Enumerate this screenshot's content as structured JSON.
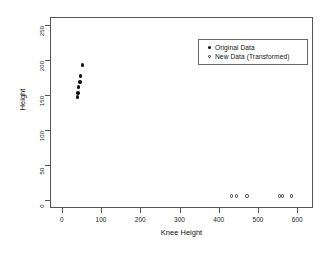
{
  "chart_data": {
    "type": "scatter",
    "title": "",
    "xlabel": "Knee Height",
    "ylabel": "Height",
    "xlim": [
      -30,
      640
    ],
    "ylim": [
      -12,
      262
    ],
    "xticks": [
      0,
      100,
      200,
      300,
      400,
      500,
      600
    ],
    "yticks": [
      0,
      50,
      100,
      150,
      200,
      250
    ],
    "xtick_labels": [
      "0",
      "100",
      "200",
      "300",
      "400",
      "500",
      "600"
    ],
    "ytick_labels": [
      "0",
      "50",
      "100",
      "150",
      "200",
      "250"
    ],
    "grid": false,
    "legend_position": "top-right",
    "series": [
      {
        "name": "Original Data",
        "marker": "filled-circle",
        "color": "#111111",
        "points": [
          {
            "x": 53,
            "y": 193
          },
          {
            "x": 48,
            "y": 177
          },
          {
            "x": 46,
            "y": 169
          },
          {
            "x": 43,
            "y": 162
          },
          {
            "x": 41,
            "y": 153
          },
          {
            "x": 40,
            "y": 147
          }
        ]
      },
      {
        "name": "New Data (Transformed)",
        "marker": "open-circle",
        "color": "#333333",
        "points": [
          {
            "x": 432,
            "y": 5
          },
          {
            "x": 445,
            "y": 5
          },
          {
            "x": 472,
            "y": 5
          },
          {
            "x": 554,
            "y": 5
          },
          {
            "x": 562,
            "y": 5
          },
          {
            "x": 585,
            "y": 5
          }
        ]
      }
    ]
  },
  "legend": {
    "entries": [
      {
        "label": "Original Data",
        "symbol": "filled-circle"
      },
      {
        "label": "New Data (Transformed)",
        "symbol": "open-circle"
      }
    ]
  },
  "axes": {
    "x_title": "Knee Height",
    "y_title": "Height"
  }
}
